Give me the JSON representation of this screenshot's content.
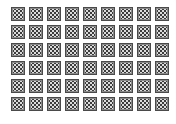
{
  "grid": {
    "rows": 6,
    "columns": 9,
    "tile_icon": "checkered-tile-icon",
    "colors": {
      "background": "#ffffff",
      "tile_border": "#4a4a4a",
      "tile_dark": "#3c3c3c",
      "tile_light": "#dcdcdc"
    }
  }
}
